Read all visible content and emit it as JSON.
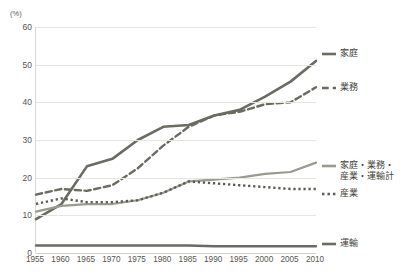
{
  "chart_data": {
    "type": "line",
    "title": "",
    "xlabel": "",
    "ylabel": "",
    "unit_label": "(%)",
    "ylim": [
      0,
      60
    ],
    "ytick_values": [
      0,
      10,
      20,
      30,
      40,
      50,
      60
    ],
    "ytick_labels": [
      "0",
      "10",
      "20",
      "30",
      "40",
      "50",
      "60"
    ],
    "grid": true,
    "legend_position": "right",
    "categories": [
      1955,
      1960,
      1965,
      1970,
      1975,
      1980,
      1985,
      1990,
      1995,
      2000,
      2005,
      2010
    ],
    "xtick_labels": [
      "1955",
      "1960",
      "1965",
      "1970",
      "1975",
      "1980",
      "1985",
      "1990",
      "1995",
      "2000",
      "2005",
      "2010"
    ],
    "series": [
      {
        "name": "家庭",
        "style": "solid",
        "color": "#6b6b63",
        "width": 2.6,
        "values": [
          9.0,
          13.0,
          23.0,
          25.0,
          30.0,
          33.5,
          34.0,
          36.5,
          38.0,
          41.5,
          45.5,
          51.0
        ]
      },
      {
        "name": "業務",
        "style": "dashed",
        "color": "#6b6b63",
        "width": 2.4,
        "values": [
          15.5,
          17.0,
          16.5,
          18.0,
          22.5,
          28.5,
          33.5,
          36.5,
          37.5,
          39.5,
          40.0,
          44.0
        ]
      },
      {
        "name": "家庭・業務・\n産業・運輸計",
        "style": "solid",
        "color": "#9a9a92",
        "width": 2.2,
        "values": [
          11.0,
          12.5,
          13.0,
          13.0,
          14.0,
          16.0,
          19.0,
          19.5,
          20.0,
          21.0,
          21.5,
          24.0
        ]
      },
      {
        "name": "産業",
        "style": "dotted",
        "color": "#5c5c55",
        "width": 2.4,
        "values": [
          13.0,
          14.5,
          13.5,
          13.5,
          14.0,
          16.0,
          19.0,
          18.5,
          18.0,
          17.5,
          17.0,
          17.0
        ]
      },
      {
        "name": "運輸",
        "style": "solid",
        "color": "#6b6b63",
        "width": 2.4,
        "values": [
          2.0,
          2.0,
          2.0,
          2.0,
          2.0,
          2.0,
          2.0,
          1.8,
          1.8,
          1.8,
          1.8,
          1.8
        ]
      }
    ],
    "legend_entries": [
      {
        "label": "家庭",
        "style": "solid",
        "color": "#6b6b63"
      },
      {
        "label": "業務",
        "style": "dashed",
        "color": "#6b6b63"
      },
      {
        "label": "家庭・業務・\n産業・運輸計",
        "style": "solid",
        "color": "#9a9a92"
      },
      {
        "label": "産業",
        "style": "dotted",
        "color": "#5c5c55"
      },
      {
        "label": "運輸",
        "style": "solid",
        "color": "#6b6b63"
      }
    ]
  }
}
